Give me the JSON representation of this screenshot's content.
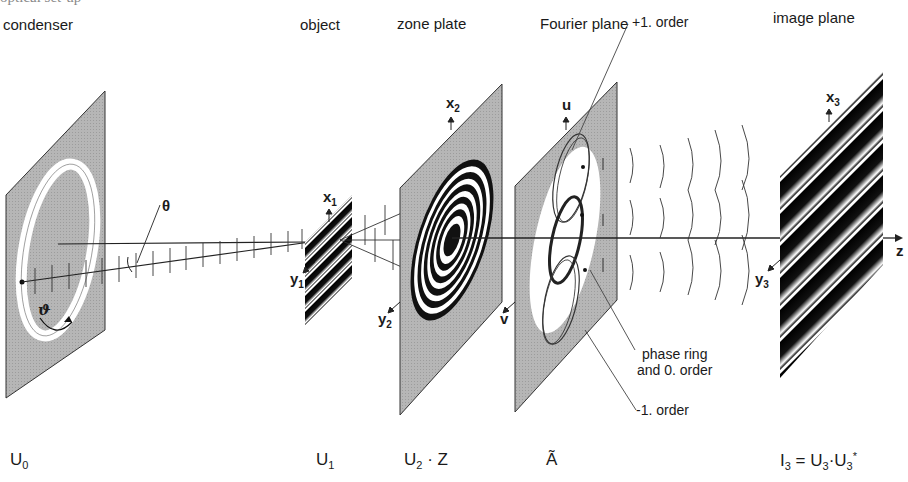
{
  "figure": {
    "top_fragment": "optical set-up",
    "stage_titles": {
      "condenser": "condenser",
      "object": "object",
      "zone_plate": "zone plate",
      "fourier_plane": "Fourier plane",
      "image_plane": "image plane"
    },
    "axes": {
      "x1": "x",
      "x1_sub": "1",
      "y1": "y",
      "y1_sub": "1",
      "x2": "x",
      "x2_sub": "2",
      "y2": "y",
      "y2_sub": "2",
      "u": "u",
      "v": "v",
      "x3": "x",
      "x3_sub": "3",
      "y3": "y",
      "y3_sub": "3",
      "z": "z"
    },
    "angles": {
      "theta": "θ",
      "vartheta": "ϑ"
    },
    "annotations": {
      "plus_first_order": "+1. order",
      "phase_ring_line1": "phase ring",
      "phase_ring_line2": "and 0. order",
      "minus_first_order": "-1. order"
    },
    "field_labels": {
      "u0": "U",
      "u0_sub": "0",
      "u1": "U",
      "u1_sub": "1",
      "u2z_u": "U",
      "u2z_sub": "2",
      "u2z_rest": " · Z",
      "a_tilde": "Ã",
      "i3": "I",
      "i3_sub": "3",
      "i3_eq": " = U",
      "i3_sub2": "3",
      "i3_dot": "·U",
      "i3_sub3": "3",
      "i3_star": "*"
    },
    "colors": {
      "plane_fill": "#b4b4b4",
      "line": "#1a1a1a",
      "stripe_dark": "#0a0a0a",
      "background": "#ffffff"
    }
  }
}
